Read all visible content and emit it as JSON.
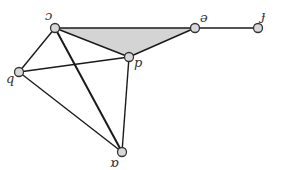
{
  "diagram": {
    "type": "graph",
    "colors": {
      "edge": "#1a1a1a",
      "node_fill": "#d8d8d8",
      "node_stroke": "#333333",
      "shaded_region": "#d4d4d4",
      "label": "#333333"
    },
    "nodes": [
      {
        "id": "c",
        "label": "ɔ",
        "x": 55,
        "y": 28,
        "lx": 45,
        "ly": 20
      },
      {
        "id": "e",
        "label": "ə",
        "x": 195,
        "y": 28,
        "lx": 200,
        "ly": 22
      },
      {
        "id": "f",
        "label": "ɟ",
        "x": 258,
        "y": 28,
        "lx": 261,
        "ly": 20
      },
      {
        "id": "d",
        "label": "p",
        "x": 129,
        "y": 57,
        "lx": 134,
        "ly": 67
      },
      {
        "id": "b",
        "label": "q",
        "x": 19,
        "y": 72,
        "lx": 6,
        "ly": 83
      },
      {
        "id": "a",
        "label": "ɒ",
        "x": 122,
        "y": 152,
        "lx": 110,
        "ly": 167
      }
    ],
    "edges": [
      {
        "from": "c",
        "to": "e"
      },
      {
        "from": "e",
        "to": "d"
      },
      {
        "from": "c",
        "to": "d"
      },
      {
        "from": "e",
        "to": "f"
      },
      {
        "from": "c",
        "to": "b"
      },
      {
        "from": "c",
        "to": "a"
      },
      {
        "from": "b",
        "to": "d"
      },
      {
        "from": "b",
        "to": "a"
      },
      {
        "from": "d",
        "to": "a"
      }
    ],
    "shaded_triangle": [
      "c",
      "e",
      "d"
    ]
  }
}
